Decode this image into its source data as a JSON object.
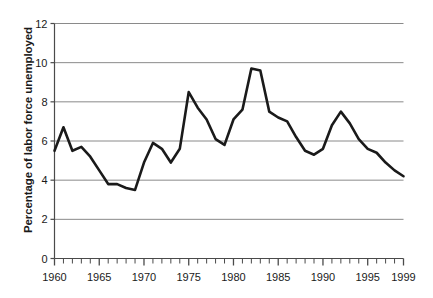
{
  "chart_data": {
    "type": "line",
    "title": "",
    "subtitle": "",
    "xlabel": "",
    "ylabel": "Percentage of labor force unemployed",
    "xlim": [
      1960,
      1999
    ],
    "ylim": [
      0,
      12
    ],
    "grid": "horizontal",
    "legend": "none",
    "y_ticks": [
      0,
      2,
      4,
      6,
      8,
      10,
      12
    ],
    "y_tick_labels": [
      "0",
      "2",
      "4",
      "6",
      "8",
      "10",
      "12"
    ],
    "x_ticks": [
      1960,
      1965,
      1970,
      1975,
      1980,
      1985,
      1990,
      1995,
      1999
    ],
    "x_tick_labels": [
      "1960",
      "1965",
      "1970",
      "1975",
      "1980",
      "1985",
      "1990",
      "1995",
      "1999"
    ],
    "x_minor_tick_interval": 1,
    "line_color": "#1a1a1a",
    "line_width": 2.6,
    "x": [
      1960,
      1961,
      1962,
      1963,
      1964,
      1965,
      1966,
      1967,
      1968,
      1969,
      1970,
      1971,
      1972,
      1973,
      1974,
      1975,
      1976,
      1977,
      1978,
      1979,
      1980,
      1981,
      1982,
      1983,
      1984,
      1985,
      1986,
      1987,
      1988,
      1989,
      1990,
      1991,
      1992,
      1993,
      1994,
      1995,
      1996,
      1997,
      1998,
      1999
    ],
    "values": [
      5.5,
      6.7,
      5.5,
      5.7,
      5.2,
      4.5,
      3.8,
      3.8,
      3.6,
      3.5,
      4.9,
      5.9,
      5.6,
      4.9,
      5.6,
      8.5,
      7.7,
      7.1,
      6.1,
      5.8,
      7.1,
      7.6,
      9.7,
      9.6,
      7.5,
      7.2,
      7.0,
      6.2,
      5.5,
      5.3,
      5.6,
      6.8,
      7.5,
      6.9,
      6.1,
      5.6,
      5.4,
      4.9,
      4.5,
      4.2
    ]
  }
}
